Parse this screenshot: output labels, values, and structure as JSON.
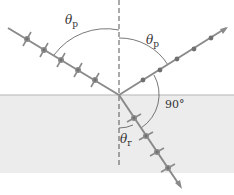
{
  "diagram": {
    "labels": {
      "incident_angle": "θ",
      "incident_angle_sub": "p",
      "reflected_angle": "θ",
      "reflected_angle_sub": "p",
      "refracted_angle": "θ",
      "refracted_angle_sub": "r",
      "right_angle": "90°"
    },
    "colors": {
      "ray": "#8a8a8a",
      "marker": "#707070",
      "water": "#ececec",
      "surface": "#b0b0b0",
      "normal": "#555555",
      "arc": "#555555"
    }
  }
}
